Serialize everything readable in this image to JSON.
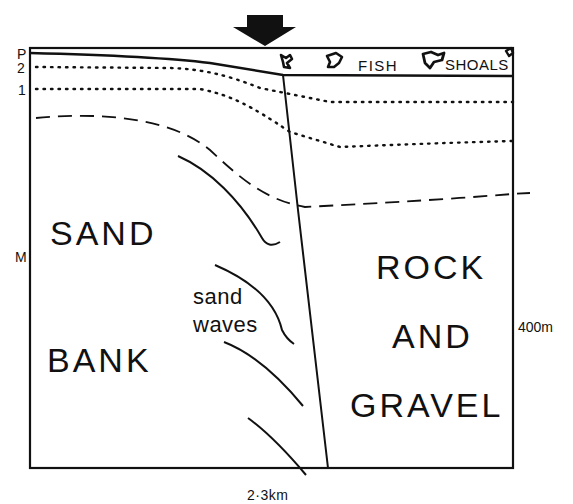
{
  "diagram": {
    "type": "geological-cross-section",
    "top_labels": {
      "fish": "FISH",
      "shoals": "SHOALS"
    },
    "left_axis_labels": {
      "p": "P",
      "two": "2",
      "one": "1",
      "m": "M"
    },
    "right_axis_label": "400m",
    "bottom_axis_label": "2·3km",
    "regions": {
      "sand": "SAND",
      "bank": "BANK",
      "sand_waves_1": "sand",
      "sand_waves_2": "waves",
      "rock": "ROCK",
      "and": "AND",
      "gravel": "GRAVEL"
    },
    "colors": {
      "ink": "#111111",
      "background": "#ffffff"
    }
  }
}
